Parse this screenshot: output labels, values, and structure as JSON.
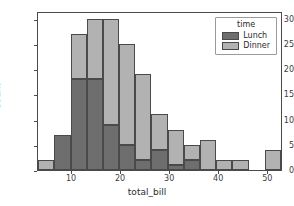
{
  "chart_data": {
    "type": "bar",
    "chart_subtype": "stacked-histogram",
    "title": "",
    "xlabel": "total_bill",
    "ylabel": "Count",
    "xlim": [
      3.07,
      53.0
    ],
    "ylim": [
      0,
      31.5
    ],
    "xticks": [
      10,
      20,
      30,
      40,
      50
    ],
    "yticks": [
      0,
      5,
      10,
      15,
      20,
      25,
      30
    ],
    "grid": false,
    "legend": {
      "title": "time",
      "position": "upper right",
      "entries": [
        {
          "name": "Lunch",
          "color": "#6e6e6e"
        },
        {
          "name": "Dinner",
          "color": "#b2b2b2"
        }
      ]
    },
    "bin_edges": [
      3.07,
      6.4,
      9.7,
      13.0,
      16.3,
      19.6,
      22.9,
      26.2,
      29.5,
      32.8,
      36.1,
      39.4,
      42.7,
      46.0,
      49.3,
      52.6
    ],
    "bin_centers": [
      4.74,
      8.05,
      11.35,
      14.65,
      17.95,
      21.25,
      24.55,
      27.85,
      31.15,
      34.45,
      37.75,
      41.05,
      44.35,
      47.65,
      50.95
    ],
    "series": [
      {
        "name": "Lunch",
        "color": "#6e6e6e",
        "values": [
          0,
          7,
          18,
          18,
          9,
          5,
          2,
          4,
          1,
          2,
          0,
          0,
          0,
          0,
          0
        ]
      },
      {
        "name": "Dinner",
        "color": "#b2b2b2",
        "values": [
          2,
          0,
          9,
          12,
          21,
          20,
          17,
          7,
          7,
          3,
          6,
          2,
          2,
          0,
          4
        ]
      }
    ],
    "totals": [
      2,
      7,
      27,
      30,
      30,
      25,
      19,
      11,
      8,
      5,
      6,
      2,
      2,
      0,
      4
    ]
  },
  "style": {
    "axis_color": "#4a4a4a",
    "edge_color": "#4a4a4a",
    "text_color": "#2b2b2b",
    "background": "#ffffff"
  }
}
